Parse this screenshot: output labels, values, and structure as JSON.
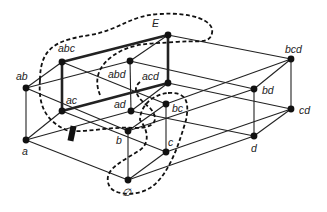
{
  "diagram": {
    "title": "",
    "nodes": [
      {
        "id": "E",
        "label": "E",
        "x": 168,
        "y": 35,
        "lx": 152,
        "ly": 27
      },
      {
        "id": "abc",
        "label": "abc",
        "x": 62,
        "y": 62,
        "lx": 58,
        "ly": 52
      },
      {
        "id": "abd",
        "label": "abd",
        "x": 130,
        "y": 61,
        "lx": 108,
        "ly": 78
      },
      {
        "id": "acd",
        "label": "acd",
        "x": 168,
        "y": 83,
        "lx": 142,
        "ly": 80
      },
      {
        "id": "bcd",
        "label": "bcd",
        "x": 291,
        "y": 59,
        "lx": 285,
        "ly": 53
      },
      {
        "id": "ab",
        "label": "ab",
        "x": 26,
        "y": 88,
        "lx": 16,
        "ly": 80
      },
      {
        "id": "ac",
        "label": "ac",
        "x": 62,
        "y": 111,
        "lx": 66,
        "ly": 104
      },
      {
        "id": "ad",
        "label": "ad",
        "x": 131,
        "y": 111,
        "lx": 114,
        "ly": 108
      },
      {
        "id": "bc",
        "label": "bc",
        "x": 166,
        "y": 104,
        "lx": 172,
        "ly": 112
      },
      {
        "id": "bd",
        "label": "bd",
        "x": 254,
        "y": 89,
        "lx": 262,
        "ly": 94
      },
      {
        "id": "cd",
        "label": "cd",
        "x": 291,
        "y": 109,
        "lx": 299,
        "ly": 114
      },
      {
        "id": "a",
        "label": "a",
        "x": 26,
        "y": 140,
        "lx": 22,
        "ly": 155
      },
      {
        "id": "b",
        "label": "b",
        "x": 128,
        "y": 131,
        "lx": 116,
        "ly": 144
      },
      {
        "id": "c",
        "label": "c",
        "x": 166,
        "y": 152,
        "lx": 168,
        "ly": 146
      },
      {
        "id": "d",
        "label": "d",
        "x": 254,
        "y": 136,
        "lx": 251,
        "ly": 152
      },
      {
        "id": "empty",
        "label": "∅",
        "x": 128,
        "y": 180,
        "lx": 122,
        "ly": 196
      }
    ],
    "edges": [
      [
        "empty",
        "a"
      ],
      [
        "empty",
        "b"
      ],
      [
        "empty",
        "c"
      ],
      [
        "empty",
        "d"
      ],
      [
        "a",
        "ab"
      ],
      [
        "a",
        "ac"
      ],
      [
        "a",
        "ad"
      ],
      [
        "b",
        "ab"
      ],
      [
        "b",
        "bc"
      ],
      [
        "b",
        "bd"
      ],
      [
        "c",
        "ac"
      ],
      [
        "c",
        "bc"
      ],
      [
        "c",
        "cd"
      ],
      [
        "d",
        "ad"
      ],
      [
        "d",
        "bd"
      ],
      [
        "d",
        "cd"
      ],
      [
        "ab",
        "abc"
      ],
      [
        "ab",
        "abd"
      ],
      [
        "ac",
        "acd"
      ],
      [
        "bc",
        "abc"
      ],
      [
        "bc",
        "bcd"
      ],
      [
        "ad",
        "abd"
      ],
      [
        "ad",
        "acd"
      ],
      [
        "bd",
        "abd"
      ],
      [
        "bd",
        "bcd"
      ],
      [
        "cd",
        "acd"
      ],
      [
        "cd",
        "bcd"
      ],
      [
        "ac",
        "abc"
      ],
      [
        "abc",
        "E"
      ],
      [
        "abd",
        "E"
      ],
      [
        "acd",
        "E"
      ],
      [
        "bcd",
        "E"
      ]
    ],
    "thick_edges": [
      [
        "abc",
        "E"
      ],
      [
        "E",
        "acd"
      ],
      [
        "acd",
        "ac"
      ],
      [
        "ac",
        "abc"
      ]
    ],
    "dashed_regions": [
      {
        "name": "region-E-abd",
        "path": "M 40,80 C 40,45 60,40 90,35 C 120,30 130,15 160,14 C 190,12 215,20 212,33 C 210,45 195,40 175,42 C 150,44 130,42 110,58 C 98,68 94,80 100,95"
      },
      {
        "name": "region-ac-bd",
        "path": "M 40,80 C 38,105 45,120 66,130 C 80,134 110,126 135,128 C 155,128 160,120 150,108 C 140,100 130,90 140,82"
      },
      {
        "name": "region-bc-empty",
        "path": "M 168,93 C 185,92 190,100 186,120 C 180,140 170,175 150,188 C 135,197 110,196 108,182 C 105,168 125,160 140,150 C 150,143 148,130 140,120 C 140,108 150,95 168,93"
      }
    ],
    "marker": {
      "name": "bar-marker",
      "x": 69,
      "y": 126,
      "w": 6,
      "h": 15
    }
  }
}
